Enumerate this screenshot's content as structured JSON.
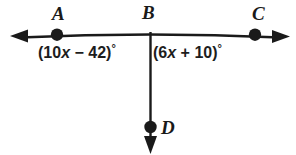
{
  "diagram": {
    "type": "geometry-angle-diagram",
    "background_color": "#ffffff",
    "stroke_color": "#1a1a1a",
    "points": [
      {
        "name": "A",
        "label": "A",
        "x": 57,
        "y": 34,
        "has_dot": true
      },
      {
        "name": "B",
        "label": "B",
        "x": 150,
        "y": 33,
        "has_dot": false
      },
      {
        "name": "C",
        "label": "C",
        "x": 255,
        "y": 34,
        "has_dot": true
      },
      {
        "name": "D",
        "label": "D",
        "x": 150,
        "y": 127,
        "has_dot": true
      }
    ],
    "lines": [
      {
        "name": "line-AC",
        "description": "horizontal double-headed arrow line through A, B, C",
        "from": {
          "x": 12,
          "y": 36
        },
        "to": {
          "x": 288,
          "y": 36
        },
        "arrow_start": true,
        "arrow_end": true
      },
      {
        "name": "ray-BD",
        "description": "vertical ray from B downward through D",
        "from": {
          "x": 150,
          "y": 33
        },
        "to": {
          "x": 150,
          "y": 152
        },
        "arrow_start": false,
        "arrow_end": true
      }
    ],
    "angles": [
      {
        "name": "angle-ABD",
        "expression": "(10x − 42)°",
        "coefficient": 10,
        "variable": "x",
        "operator": "−",
        "constant": 42,
        "prefix": "(10",
        "var_text": "x",
        "mid": " − 42)",
        "degree": "°"
      },
      {
        "name": "angle-DBC",
        "expression": "(6x + 10)°",
        "coefficient": 6,
        "variable": "x",
        "operator": "+",
        "constant": 10,
        "prefix": "(6",
        "var_text": "x",
        "mid": " + 10)",
        "degree": "°"
      }
    ]
  }
}
